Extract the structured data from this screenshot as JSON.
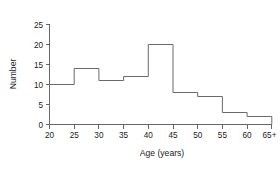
{
  "chart_data": {
    "type": "bar",
    "title": "",
    "xlabel": "Age (years)",
    "ylabel": "Number",
    "categories": [
      "20-25",
      "25-30",
      "30-35",
      "35-40",
      "40-45",
      "45-50",
      "50-55",
      "55-60",
      "60-65+"
    ],
    "bin_edges": [
      20,
      25,
      30,
      35,
      40,
      45,
      50,
      55,
      60,
      65
    ],
    "values": [
      10,
      14,
      11,
      12,
      20,
      8,
      7,
      3,
      2
    ],
    "xtick_labels": [
      "20",
      "25",
      "30",
      "35",
      "40",
      "45",
      "50",
      "55",
      "60",
      "65+"
    ],
    "ytick_labels": [
      "0",
      "5",
      "10",
      "15",
      "20",
      "25"
    ],
    "ytick_values": [
      0,
      5,
      10,
      15,
      20,
      25
    ],
    "xlim": [
      20,
      65
    ],
    "ylim": [
      0,
      25
    ],
    "grid": false,
    "legend": false,
    "style": "step-outline",
    "line_color": "#6b6b6b",
    "axis_color": "#555555",
    "background_color": "#ffffff"
  }
}
